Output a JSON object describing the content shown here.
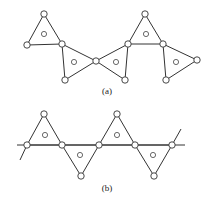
{
  "figures": [
    {
      "id": "a",
      "label": "(a)",
      "label_pos": [
        107,
        86
      ],
      "description": "Chain of corner-sharing triangles (zigzag), each with a central circle",
      "lines": [],
      "triangles": [
        {
          "vertices": [
            [
              44,
              14
            ],
            [
              27,
              45
            ],
            [
              62,
              44
            ]
          ],
          "center": [
            44,
            34
          ]
        },
        {
          "vertices": [
            [
              62,
              44
            ],
            [
              65,
              80
            ],
            [
              96,
              61
            ]
          ],
          "center": [
            74,
            62
          ]
        },
        {
          "vertices": [
            [
              96,
              61
            ],
            [
              128,
              44
            ],
            [
              125,
              80
            ]
          ],
          "center": [
            116,
            62
          ]
        },
        {
          "vertices": [
            [
              128,
              44
            ],
            [
              145,
              14
            ],
            [
              163,
              44
            ]
          ],
          "center": [
            146,
            34
          ]
        },
        {
          "vertices": [
            [
              163,
              44
            ],
            [
              166,
              80
            ],
            [
              197,
              60
            ]
          ],
          "center": [
            176,
            62
          ]
        }
      ]
    },
    {
      "id": "b",
      "label": "(b)",
      "label_pos": [
        107,
        183
      ],
      "description": "Alternating up/down triangles sharing vertices along a horizontal line",
      "lines": [
        {
          "from": [
            17,
            145
          ],
          "to": [
            185,
            145
          ]
        },
        {
          "from": [
            27,
            145
          ],
          "to": [
            20,
            160
          ]
        },
        {
          "from": [
            172,
            145
          ],
          "to": [
            181,
            129
          ]
        }
      ],
      "triangles": [
        {
          "vertices": [
            [
              27,
              145
            ],
            [
              44,
              114
            ],
            [
              62,
              145
            ]
          ],
          "center": [
            45,
            135
          ]
        },
        {
          "vertices": [
            [
              62,
              145
            ],
            [
              81,
              176
            ],
            [
              99,
              145
            ]
          ],
          "center": [
            80,
            155
          ]
        },
        {
          "vertices": [
            [
              99,
              145
            ],
            [
              117,
              114
            ],
            [
              135,
              145
            ]
          ],
          "center": [
            117,
            135
          ]
        },
        {
          "vertices": [
            [
              135,
              145
            ],
            [
              154,
              176
            ],
            [
              172,
              145
            ]
          ],
          "center": [
            153,
            155
          ]
        }
      ]
    }
  ],
  "style": {
    "stroke": "#333333",
    "node_radius": 3.2,
    "center_radius": 2.6
  }
}
